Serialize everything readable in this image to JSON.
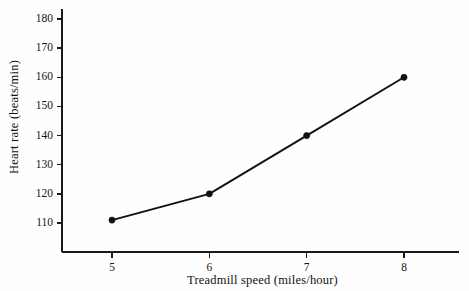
{
  "chart_data": {
    "type": "line",
    "title": "",
    "subtitle": "",
    "xlabel": "Treadmill speed (miles/hour)",
    "ylabel": "Heart rate (beats/min)",
    "x": [
      5,
      6,
      7,
      8
    ],
    "values": [
      111,
      120,
      140,
      160
    ],
    "series": [
      {
        "name": "Heart rate",
        "values": [
          111,
          120,
          140,
          160
        ]
      }
    ],
    "xlim": [
      4.486,
      8.567
    ],
    "ylim": [
      100.05,
      180
    ],
    "xticks": [
      5,
      6,
      7,
      8
    ],
    "xtick_labels": [
      "5",
      "6",
      "7",
      "8"
    ],
    "yticks": [
      110,
      120,
      130,
      140,
      150,
      160,
      170,
      180
    ],
    "ytick_labels": [
      "110",
      "120",
      "130",
      "140",
      "150",
      "160",
      "170",
      "180"
    ],
    "grid": false,
    "legend": false,
    "legend_position": "none",
    "marker": "filled-circle",
    "line_color": "#111111",
    "marker_color": "#111111",
    "background_color": "#fefefe",
    "axis_color": "#1a1a1a"
  }
}
